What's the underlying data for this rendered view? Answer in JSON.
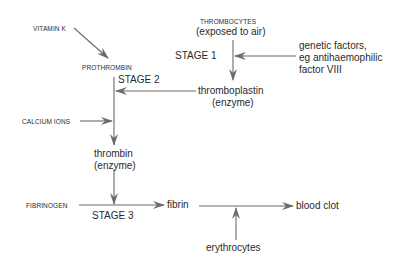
{
  "colors": {
    "line": "#6b6b6b",
    "text": "#2a2a2a",
    "background": "#ffffff"
  },
  "nodes": {
    "vitamin_k": "VITAMIN K",
    "prothrombin": "PROTHROMBIN",
    "stage2": "STAGE 2",
    "thrombocytes": "THROMBOCYTES",
    "exposed_to_air": "(exposed to air)",
    "stage1": "STAGE 1",
    "genetic_line1": "genetic factors,",
    "genetic_line2": "eg antihaemophilic",
    "genetic_line3": "factor VIII",
    "thromboplastin": "thromboplastin",
    "thromboplastin_enzyme": "(enzyme)",
    "calcium_ions": "CALCIUM IONS",
    "thrombin": "thrombin",
    "thrombin_enzyme": "(enzyme)",
    "fibrinogen": "FIBRINOGEN",
    "stage3": "STAGE 3",
    "fibrin": "fibrin",
    "blood_clot": "blood clot",
    "erythrocytes": "erythrocytes"
  },
  "edges": [
    {
      "from": "vitamin_k",
      "to": "prothrombin"
    },
    {
      "from": "thrombocytes",
      "to": "thromboplastin",
      "label": "stage1"
    },
    {
      "from": "genetic_factors",
      "to": "stage1_line"
    },
    {
      "from": "thromboplastin",
      "to": "stage2_line"
    },
    {
      "from": "prothrombin",
      "to": "thrombin",
      "label": "stage2"
    },
    {
      "from": "calcium_ions",
      "to": "stage2_line"
    },
    {
      "from": "thrombin",
      "to": "stage3_line"
    },
    {
      "from": "fibrinogen",
      "to": "fibrin",
      "label": "stage3"
    },
    {
      "from": "fibrin",
      "to": "blood_clot"
    },
    {
      "from": "erythrocytes",
      "to": "fibrin_clot_line"
    }
  ]
}
